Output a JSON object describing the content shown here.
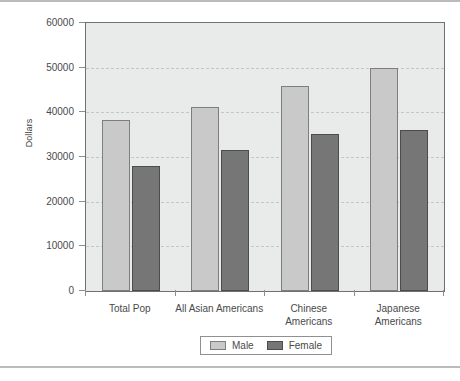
{
  "chart_data": {
    "type": "bar",
    "title": "",
    "xlabel": "",
    "ylabel": "Dollars",
    "ylim": [
      0,
      60000
    ],
    "ytick_step": 10000,
    "yticks": [
      0,
      10000,
      20000,
      30000,
      40000,
      50000,
      60000
    ],
    "ytick_labels": [
      "0",
      "10000",
      "20000",
      "30000",
      "40000",
      "50000",
      "60000"
    ],
    "grid": true,
    "grid_axis": "y",
    "legend_position": "bottom-center",
    "categories": [
      "Total Pop",
      "All Asian Americans",
      "Chinese Americans",
      "Japanese Americans"
    ],
    "category_lines": [
      [
        "Total Pop"
      ],
      [
        "All Asian Americans"
      ],
      [
        "Chinese",
        "Americans"
      ],
      [
        "Japanese",
        "Americans"
      ]
    ],
    "series": [
      {
        "name": "Male",
        "color": "#c9c9c9",
        "edge_color": "#7e7e7e",
        "values": [
          38200,
          41100,
          45800,
          50000
        ]
      },
      {
        "name": "Female",
        "color": "#767676",
        "edge_color": "#4c4c4c",
        "values": [
          28100,
          31500,
          35200,
          36000
        ]
      }
    ],
    "plot_background": "#e9eaea",
    "frame_color": "#6f7072"
  },
  "legend": {
    "items": [
      {
        "label": "Male",
        "swatch": "male-swatch"
      },
      {
        "label": "Female",
        "swatch": "female-swatch"
      }
    ]
  },
  "axis": {
    "y_title": "Dollars"
  }
}
